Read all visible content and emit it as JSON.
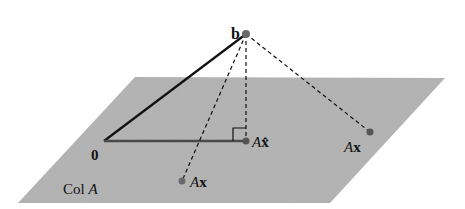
{
  "diagram": {
    "plane": {
      "label_prefix": "Col ",
      "label_var": "A",
      "color": "#b5b5b5",
      "corners": [
        [
          135,
          77
        ],
        [
          445,
          78
        ],
        [
          330,
          203
        ],
        [
          18,
          203
        ]
      ]
    },
    "points": {
      "b": {
        "label": "b",
        "x": 246,
        "y": 34
      },
      "origin": {
        "label": "0",
        "x": 104,
        "y": 141
      },
      "projection": {
        "label_var": "A",
        "label_vec": "x̂",
        "x": 246,
        "y": 141
      },
      "ax_right": {
        "label_var": "A",
        "label_vec": "x",
        "x": 370,
        "y": 132
      },
      "ax_lower": {
        "label_var": "A",
        "label_vec": "x",
        "x": 182,
        "y": 181
      }
    },
    "colors": {
      "line": "#111111",
      "point": "#6a6a6a",
      "projection_line": "#4a4a4a"
    }
  }
}
